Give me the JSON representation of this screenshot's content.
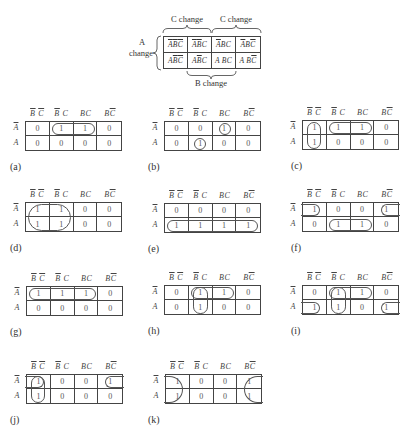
{
  "reference": {
    "c_change_labels": [
      "C change",
      "C change"
    ],
    "a_change_label": [
      "A",
      "change"
    ],
    "b_change_label": "B change",
    "cells": [
      [
        "A̅ B̅ C̅",
        "A̅ B̅ C",
        "A̅ BC",
        "A̅ BC̅"
      ],
      [
        "A B̅ C̅",
        "A B̅ C",
        "A BC",
        "A BC̅"
      ]
    ]
  },
  "maps": [
    {
      "label": "(a)",
      "col_headers": [
        "B̅ C̅",
        "B̅ C",
        "BC",
        "BC̅"
      ],
      "row_headers": [
        "A̅",
        "A"
      ],
      "values": [
        [
          0,
          1,
          1,
          0
        ],
        [
          0,
          0,
          0,
          0
        ]
      ],
      "loops": [
        {
          "r": [
            0,
            0
          ],
          "c": [
            1,
            2
          ]
        }
      ]
    },
    {
      "label": "(b)",
      "col_headers": [
        "B̅ C̅",
        "B̅ C",
        "BC",
        "BC̅"
      ],
      "row_headers": [
        "A̅",
        "A"
      ],
      "values": [
        [
          0,
          0,
          1,
          0
        ],
        [
          0,
          1,
          0,
          0
        ]
      ],
      "loops": [
        {
          "r": [
            0,
            0
          ],
          "c": [
            2,
            2
          ]
        },
        {
          "r": [
            1,
            1
          ],
          "c": [
            1,
            1
          ]
        }
      ]
    },
    {
      "label": "(c)",
      "col_headers": [
        "B̅ C̅",
        "B̅ C",
        "BC",
        "BC̅"
      ],
      "row_headers": [
        "A̅",
        "A"
      ],
      "values": [
        [
          1,
          1,
          1,
          0
        ],
        [
          1,
          0,
          0,
          0
        ]
      ],
      "loops": [
        {
          "r": [
            0,
            1
          ],
          "c": [
            0,
            0
          ]
        },
        {
          "r": [
            0,
            0
          ],
          "c": [
            1,
            2
          ]
        }
      ]
    },
    {
      "label": "(d)",
      "col_headers": [
        "B̅ C̅",
        "B̅ C",
        "BC",
        "BC̅"
      ],
      "row_headers": [
        "A̅",
        "A"
      ],
      "values": [
        [
          1,
          1,
          0,
          0
        ],
        [
          1,
          1,
          0,
          0
        ]
      ],
      "loops": [
        {
          "r": [
            0,
            1
          ],
          "c": [
            0,
            1
          ]
        }
      ]
    },
    {
      "label": "(e)",
      "col_headers": [
        "B̅ C̅",
        "B̅ C",
        "BC",
        "BC̅"
      ],
      "row_headers": [
        "A̅",
        "A"
      ],
      "values": [
        [
          0,
          0,
          0,
          0
        ],
        [
          1,
          1,
          1,
          1
        ]
      ],
      "loops": [
        {
          "r": [
            1,
            1
          ],
          "c": [
            0,
            3
          ]
        }
      ]
    },
    {
      "label": "(f)",
      "col_headers": [
        "B̅ C̅",
        "B̅ C",
        "BC",
        "BC̅"
      ],
      "row_headers": [
        "A̅",
        "A"
      ],
      "values": [
        [
          1,
          0,
          0,
          1
        ],
        [
          0,
          1,
          1,
          0
        ]
      ],
      "loops": [
        {
          "r": [
            0,
            0
          ],
          "c": [
            0,
            0
          ],
          "open": "left"
        },
        {
          "r": [
            0,
            0
          ],
          "c": [
            3,
            3
          ],
          "open": "right"
        },
        {
          "r": [
            1,
            1
          ],
          "c": [
            1,
            2
          ]
        }
      ]
    },
    {
      "label": "(g)",
      "col_headers": [
        "B̅ C̅",
        "B̅ C",
        "BC",
        "BC̅"
      ],
      "row_headers": [
        "A̅",
        "A"
      ],
      "values": [
        [
          1,
          1,
          1,
          0
        ],
        [
          0,
          0,
          0,
          0
        ]
      ],
      "loops": [
        {
          "r": [
            0,
            0
          ],
          "c": [
            0,
            2
          ]
        }
      ]
    },
    {
      "label": "(h)",
      "col_headers": [
        "B̅ C̅",
        "B̅ C",
        "BC",
        "BC̅"
      ],
      "row_headers": [
        "A̅",
        "A"
      ],
      "values": [
        [
          0,
          1,
          1,
          0
        ],
        [
          0,
          1,
          0,
          0
        ]
      ],
      "loops": [
        {
          "r": [
            0,
            0
          ],
          "c": [
            1,
            2
          ]
        },
        {
          "r": [
            0,
            1
          ],
          "c": [
            1,
            1
          ]
        }
      ]
    },
    {
      "label": "(i)",
      "col_headers": [
        "B̅ C̅",
        "B̅ C",
        "BC",
        "BC̅"
      ],
      "row_headers": [
        "A̅",
        "A"
      ],
      "values": [
        [
          0,
          1,
          1,
          0
        ],
        [
          1,
          1,
          0,
          1
        ]
      ],
      "loops": [
        {
          "r": [
            0,
            0
          ],
          "c": [
            1,
            2
          ]
        },
        {
          "r": [
            0,
            1
          ],
          "c": [
            1,
            1
          ]
        },
        {
          "r": [
            1,
            1
          ],
          "c": [
            0,
            0
          ],
          "open": "left"
        },
        {
          "r": [
            1,
            1
          ],
          "c": [
            3,
            3
          ],
          "open": "right"
        }
      ]
    },
    {
      "label": "(j)",
      "col_headers": [
        "B̅ C̅",
        "B̅ C",
        "BC",
        "BC̅"
      ],
      "row_headers": [
        "A̅",
        "A"
      ],
      "values": [
        [
          1,
          0,
          0,
          1
        ],
        [
          1,
          0,
          0,
          0
        ]
      ],
      "loops": [
        {
          "r": [
            0,
            1
          ],
          "c": [
            0,
            0
          ]
        },
        {
          "r": [
            0,
            0
          ],
          "c": [
            0,
            0
          ],
          "open": "left"
        },
        {
          "r": [
            0,
            0
          ],
          "c": [
            3,
            3
          ],
          "open": "right"
        }
      ]
    },
    {
      "label": "(k)",
      "col_headers": [
        "B̅ C̅",
        "B̅ C",
        "BC",
        "BC̅"
      ],
      "row_headers": [
        "A̅",
        "A"
      ],
      "values": [
        [
          1,
          0,
          0,
          1
        ],
        [
          1,
          0,
          0,
          1
        ]
      ],
      "loops": [
        {
          "r": [
            0,
            1
          ],
          "c": [
            0,
            0
          ],
          "open": "left"
        },
        {
          "r": [
            0,
            1
          ],
          "c": [
            3,
            3
          ],
          "open": "right"
        }
      ]
    }
  ]
}
